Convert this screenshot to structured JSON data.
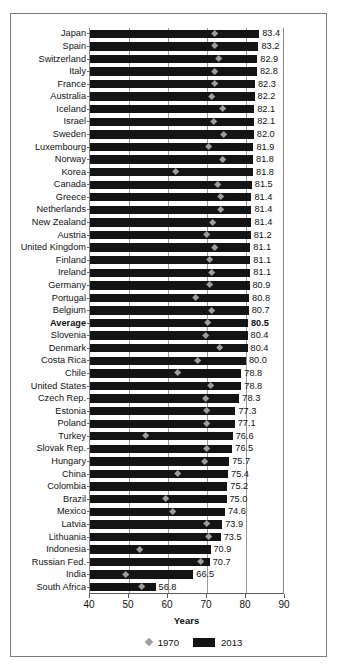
{
  "chart_data": {
    "type": "bar",
    "title": "",
    "xlabel": "Years",
    "ylabel": "",
    "xlim": [
      40,
      90
    ],
    "xticks": [
      40,
      50,
      60,
      70,
      80,
      90
    ],
    "gridlines": [
      50,
      60,
      70,
      80
    ],
    "grid": true,
    "legend_position": "bottom",
    "legend": [
      {
        "label": "1970",
        "marker": "diamond",
        "color": "#9d9d9d"
      },
      {
        "label": "2013",
        "marker": "bar",
        "color": "#141414"
      }
    ],
    "series": [
      {
        "name": "2013",
        "type": "bar",
        "color": "#141414"
      },
      {
        "name": "1970",
        "type": "diamond",
        "color": "#9d9d9d"
      }
    ],
    "categories": [
      "Japan",
      "Spain",
      "Switzerland",
      "Italy",
      "France",
      "Australia",
      "Iceland",
      "Israel",
      "Sweden",
      "Luxembourg",
      "Norway",
      "Korea",
      "Canada",
      "Greece",
      "Netherlands",
      "New Zealand",
      "Austria",
      "United Kingdom",
      "Finland",
      "Ireland",
      "Germany",
      "Portugal",
      "Belgium",
      "Average",
      "Slovenia",
      "Denmark",
      "Costa Rica",
      "Chile",
      "United States",
      "Czech Rep.",
      "Estonia",
      "Poland",
      "Turkey",
      "Slovak Rep.",
      "Hungary",
      "China",
      "Colombia",
      "Brazil",
      "Mexico",
      "Latvia",
      "Lithuania",
      "Indonesia",
      "Russian Fed.",
      "India",
      "South Africa"
    ],
    "rows": [
      {
        "category": "Japan",
        "v2013": 83.4,
        "v1970": 72.0,
        "bold": false
      },
      {
        "category": "Spain",
        "v2013": 83.2,
        "v1970": 71.9,
        "bold": false
      },
      {
        "category": "Switzerland",
        "v2013": 82.9,
        "v1970": 73.0,
        "bold": false
      },
      {
        "category": "Italy",
        "v2013": 82.8,
        "v1970": 72.0,
        "bold": false
      },
      {
        "category": "France",
        "v2013": 82.3,
        "v1970": 72.0,
        "bold": false
      },
      {
        "category": "Australia",
        "v2013": 82.2,
        "v1970": 71.2,
        "bold": false
      },
      {
        "category": "Iceland",
        "v2013": 82.1,
        "v1970": 73.9,
        "bold": false
      },
      {
        "category": "Israel",
        "v2013": 82.1,
        "v1970": 71.6,
        "bold": false
      },
      {
        "category": "Sweden",
        "v2013": 82.0,
        "v1970": 74.4,
        "bold": false
      },
      {
        "category": "Luxembourg",
        "v2013": 81.9,
        "v1970": 70.5,
        "bold": false
      },
      {
        "category": "Norway",
        "v2013": 81.8,
        "v1970": 74.0,
        "bold": false
      },
      {
        "category": "Korea",
        "v2013": 81.8,
        "v1970": 62.0,
        "bold": false
      },
      {
        "category": "Canada",
        "v2013": 81.5,
        "v1970": 72.8,
        "bold": false
      },
      {
        "category": "Greece",
        "v2013": 81.4,
        "v1970": 73.5,
        "bold": false
      },
      {
        "category": "Netherlands",
        "v2013": 81.4,
        "v1970": 73.6,
        "bold": false
      },
      {
        "category": "New Zealand",
        "v2013": 81.4,
        "v1970": 71.4,
        "bold": false
      },
      {
        "category": "Austria",
        "v2013": 81.2,
        "v1970": 70.0,
        "bold": false
      },
      {
        "category": "United Kingdom",
        "v2013": 81.1,
        "v1970": 71.9,
        "bold": false
      },
      {
        "category": "Finland",
        "v2013": 81.1,
        "v1970": 70.8,
        "bold": false
      },
      {
        "category": "Ireland",
        "v2013": 81.1,
        "v1970": 71.2,
        "bold": false
      },
      {
        "category": "Germany",
        "v2013": 80.9,
        "v1970": 70.6,
        "bold": false
      },
      {
        "category": "Portugal",
        "v2013": 80.8,
        "v1970": 67.1,
        "bold": false
      },
      {
        "category": "Belgium",
        "v2013": 80.7,
        "v1970": 71.3,
        "bold": false
      },
      {
        "category": "Average",
        "v2013": 80.5,
        "v1970": 70.2,
        "bold": true
      },
      {
        "category": "Slovenia",
        "v2013": 80.4,
        "v1970": 69.6,
        "bold": false
      },
      {
        "category": "Denmark",
        "v2013": 80.4,
        "v1970": 73.3,
        "bold": false
      },
      {
        "category": "Costa Rica",
        "v2013": 80.0,
        "v1970": 67.5,
        "bold": false
      },
      {
        "category": "Chile",
        "v2013": 78.8,
        "v1970": 62.4,
        "bold": false
      },
      {
        "category": "United States",
        "v2013": 78.8,
        "v1970": 70.9,
        "bold": false
      },
      {
        "category": "Czech Rep.",
        "v2013": 78.3,
        "v1970": 69.6,
        "bold": false
      },
      {
        "category": "Estonia",
        "v2013": 77.3,
        "v1970": 70.0,
        "bold": false
      },
      {
        "category": "Poland",
        "v2013": 77.1,
        "v1970": 70.0,
        "bold": false
      },
      {
        "category": "Turkey",
        "v2013": 76.6,
        "v1970": 54.2,
        "bold": false
      },
      {
        "category": "Slovak Rep.",
        "v2013": 76.5,
        "v1970": 69.8,
        "bold": false
      },
      {
        "category": "Hungary",
        "v2013": 75.7,
        "v1970": 69.3,
        "bold": false
      },
      {
        "category": "China",
        "v2013": 75.4,
        "v1970": 62.6,
        "bold": false
      },
      {
        "category": "Colombia",
        "v2013": 75.2,
        "v1970": null,
        "bold": false
      },
      {
        "category": "Brazil",
        "v2013": 75.0,
        "v1970": 59.5,
        "bold": false
      },
      {
        "category": "Mexico",
        "v2013": 74.6,
        "v1970": 61.1,
        "bold": false
      },
      {
        "category": "Latvia",
        "v2013": 73.9,
        "v1970": 69.8,
        "bold": false
      },
      {
        "category": "Lithuania",
        "v2013": 73.5,
        "v1970": 70.4,
        "bold": false
      },
      {
        "category": "Indonesia",
        "v2013": 70.9,
        "v1970": 52.8,
        "bold": false
      },
      {
        "category": "Russian Fed.",
        "v2013": 70.7,
        "v1970": 68.5,
        "bold": false
      },
      {
        "category": "India",
        "v2013": 66.5,
        "v1970": 49.1,
        "bold": false
      },
      {
        "category": "South Africa",
        "v2013": 56.8,
        "v1970": 53.2,
        "bold": false
      }
    ]
  }
}
